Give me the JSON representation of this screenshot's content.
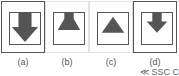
{
  "figure": {
    "panels": [
      {
        "id": "a",
        "label": "(a)",
        "icon": "arrow-down-icon",
        "selected": true
      },
      {
        "id": "b",
        "label": "(b)",
        "icon": "funnel-triangle-up-icon",
        "selected": false
      },
      {
        "id": "c",
        "label": "(c)",
        "icon": "triangle-up-icon",
        "selected": false
      },
      {
        "id": "d",
        "label": "(d)",
        "icon": "arrow-down-small-icon",
        "selected": true
      }
    ],
    "watermark": "≪ SSC CGL",
    "colors": {
      "stroke": "#555555",
      "fill": "#555555",
      "background": "#ffffff"
    }
  }
}
